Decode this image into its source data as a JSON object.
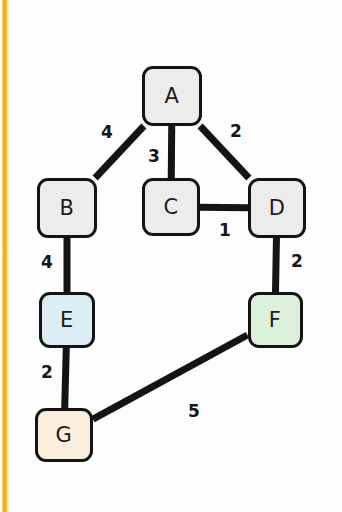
{
  "canvas": {
    "width": 342,
    "height": 512,
    "background": "#fdfdfd",
    "accent_color": "#f0a90f"
  },
  "diagram": {
    "kind": "weighted-undirected-graph",
    "node_border_color": "#141414",
    "edge_color": "#141414"
  },
  "chart_data": {
    "type": "diagram",
    "title": "",
    "nodes": [
      {
        "id": "A",
        "label": "A",
        "x": 172,
        "y": 96,
        "w": 60,
        "h": 60,
        "fill": "#ececec"
      },
      {
        "id": "B",
        "label": "B",
        "x": 67,
        "y": 208,
        "w": 60,
        "h": 60,
        "fill": "#ececec"
      },
      {
        "id": "C",
        "label": "C",
        "x": 171,
        "y": 207,
        "w": 58,
        "h": 58,
        "fill": "#ececec"
      },
      {
        "id": "D",
        "label": "D",
        "x": 277,
        "y": 208,
        "w": 58,
        "h": 60,
        "fill": "#ececec"
      },
      {
        "id": "E",
        "label": "E",
        "x": 67,
        "y": 320,
        "w": 56,
        "h": 56,
        "fill": "#dcedf5"
      },
      {
        "id": "F",
        "label": "F",
        "x": 275,
        "y": 320,
        "w": 55,
        "h": 56,
        "fill": "#ddf0dc"
      },
      {
        "id": "G",
        "label": "G",
        "x": 64,
        "y": 435,
        "w": 58,
        "h": 54,
        "fill": "#faeedc"
      }
    ],
    "edges": [
      {
        "source": "A",
        "target": "B",
        "weight": 4,
        "label_x": 107,
        "label_y": 133
      },
      {
        "source": "A",
        "target": "C",
        "weight": 3,
        "label_x": 154,
        "label_y": 157
      },
      {
        "source": "A",
        "target": "D",
        "weight": 2,
        "label_x": 236,
        "label_y": 132
      },
      {
        "source": "C",
        "target": "D",
        "weight": 1,
        "label_x": 225,
        "label_y": 231
      },
      {
        "source": "B",
        "target": "E",
        "weight": 4,
        "label_x": 47,
        "y_note": "left of B-E line",
        "label_y": 263
      },
      {
        "source": "D",
        "target": "F",
        "weight": 2,
        "label_x": 297,
        "label_y": 262
      },
      {
        "source": "E",
        "target": "G",
        "weight": 2,
        "label_x": 47,
        "label_y": 373
      },
      {
        "source": "G",
        "target": "F",
        "weight": 5,
        "label_x": 194,
        "label_y": 412
      }
    ],
    "node_labels": [
      "A",
      "B",
      "C",
      "D",
      "E",
      "F",
      "G"
    ],
    "edge_weights": [
      4,
      3,
      2,
      1,
      4,
      2,
      2,
      5
    ]
  }
}
